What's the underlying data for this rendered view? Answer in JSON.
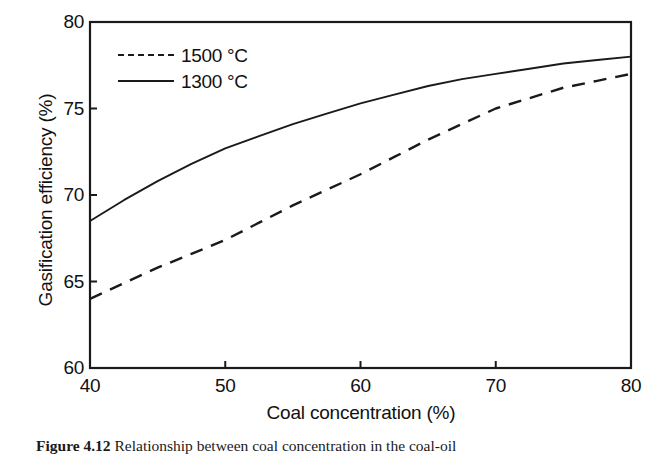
{
  "figure": {
    "caption_number": "Figure 4.12",
    "caption_text": "Relationship between coal concentration in the coal-oil"
  },
  "chart_data": {
    "type": "line",
    "title": "",
    "xlabel": "Coal concentration (%)",
    "ylabel": "Gasification efficiency (%)",
    "xlim": [
      40,
      80
    ],
    "ylim": [
      60,
      80
    ],
    "xticks": [
      40,
      50,
      60,
      70,
      80
    ],
    "yticks": [
      60,
      65,
      70,
      75,
      80
    ],
    "xtick_labels": [
      "40",
      "50",
      "60",
      "70",
      "80"
    ],
    "ytick_labels": [
      "60",
      "65",
      "70",
      "75",
      "80"
    ],
    "grid": false,
    "legend_position": "upper-left-inside",
    "line_color": "#1a1a1a",
    "series": [
      {
        "name": "1500 °C",
        "style": "dashed",
        "x": [
          40,
          42.5,
          45,
          47.5,
          50,
          52.5,
          55,
          57.5,
          60,
          62.5,
          65,
          67.5,
          70,
          72.5,
          75,
          77.5,
          80
        ],
        "values": [
          64.0,
          64.9,
          65.8,
          66.6,
          67.4,
          68.4,
          69.4,
          70.3,
          71.2,
          72.2,
          73.2,
          74.1,
          75.0,
          75.6,
          76.2,
          76.6,
          77.0
        ]
      },
      {
        "name": "1300 °C",
        "style": "solid",
        "x": [
          40,
          42.5,
          45,
          47.5,
          50,
          52.5,
          55,
          57.5,
          60,
          62.5,
          65,
          67.5,
          70,
          72.5,
          75,
          77.5,
          80
        ],
        "values": [
          68.5,
          69.7,
          70.8,
          71.8,
          72.7,
          73.4,
          74.1,
          74.7,
          75.3,
          75.8,
          76.3,
          76.7,
          77.0,
          77.3,
          77.6,
          77.8,
          78.0
        ]
      }
    ]
  },
  "legend": {
    "items": [
      {
        "label": "1500 °C",
        "style": "dashed"
      },
      {
        "label": "1300 °C",
        "style": "solid"
      }
    ]
  }
}
